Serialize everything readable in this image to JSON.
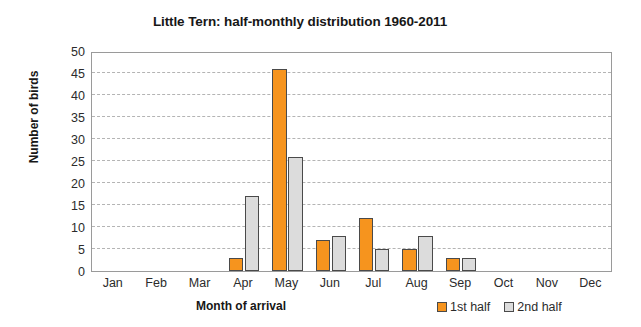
{
  "chart_data": {
    "type": "bar",
    "title": "Little Tern: half-monthly distribution 1960-2011",
    "xlabel": "Month of arrival",
    "ylabel": "Number of birds",
    "categories": [
      "Jan",
      "Feb",
      "Mar",
      "Apr",
      "May",
      "Jun",
      "Jul",
      "Aug",
      "Sep",
      "Oct",
      "Nov",
      "Dec"
    ],
    "series": [
      {
        "name": "1st half",
        "color": "#F6941E",
        "values": [
          0,
          0,
          0,
          3,
          46,
          7,
          12,
          5,
          3,
          0,
          0,
          0
        ]
      },
      {
        "name": "2nd half",
        "color": "#DCDCDC",
        "values": [
          0,
          0,
          0,
          17,
          26,
          8,
          5,
          8,
          3,
          0,
          0,
          0
        ]
      }
    ],
    "ylim": [
      0,
      50
    ],
    "yticks": [
      0,
      5,
      10,
      15,
      20,
      25,
      30,
      35,
      40,
      45,
      50
    ],
    "ytick_labels": [
      "0",
      "5",
      "10",
      "15",
      "20",
      "25",
      "30",
      "35",
      "40",
      "45",
      "50"
    ],
    "grid": "horizontal-dashed",
    "legend_position": "bottom-right"
  },
  "legend": {
    "entries": [
      {
        "label": "1st half",
        "swatch": "orange-square-swatch"
      },
      {
        "label": "2nd half",
        "swatch": "gray-square-swatch"
      }
    ]
  }
}
